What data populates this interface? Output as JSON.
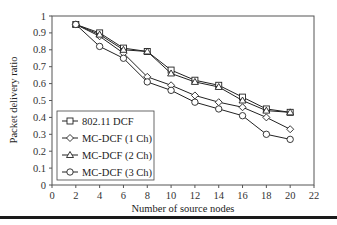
{
  "chart_data": {
    "type": "line",
    "title": "",
    "xlabel": "Number of source nodes",
    "ylabel": "Packet delivery ratio",
    "xlim": [
      0,
      22
    ],
    "ylim": [
      0,
      1
    ],
    "x_ticks": [
      "0",
      "2",
      "4",
      "6",
      "8",
      "10",
      "12",
      "14",
      "16",
      "18",
      "20",
      "22"
    ],
    "y_ticks": [
      "0",
      "0.1",
      "0.2",
      "0.3",
      "0.4",
      "0.5",
      "0.6",
      "0.7",
      "0.8",
      "0.9",
      "1"
    ],
    "grid": false,
    "legend_position": "lower left (inside plot)",
    "x": [
      2,
      4,
      6,
      8,
      10,
      12,
      14,
      16,
      18,
      20
    ],
    "series": [
      {
        "name": "802.11 DCF",
        "marker": "square",
        "values": [
          0.95,
          0.9,
          0.81,
          0.79,
          0.68,
          0.62,
          0.59,
          0.52,
          0.45,
          0.43
        ]
      },
      {
        "name": "MC-DCF (1 Ch)",
        "marker": "diamond",
        "values": [
          0.95,
          0.88,
          0.78,
          0.64,
          0.59,
          0.53,
          0.49,
          0.46,
          0.4,
          0.33
        ]
      },
      {
        "name": "MC-DCF (2 Ch)",
        "marker": "triangle",
        "values": [
          0.95,
          0.89,
          0.8,
          0.79,
          0.66,
          0.61,
          0.58,
          0.5,
          0.44,
          0.43
        ]
      },
      {
        "name": "MC-DCF (3 Ch)",
        "marker": "circle",
        "values": [
          0.95,
          0.82,
          0.75,
          0.61,
          0.56,
          0.49,
          0.45,
          0.41,
          0.3,
          0.27
        ]
      }
    ]
  }
}
